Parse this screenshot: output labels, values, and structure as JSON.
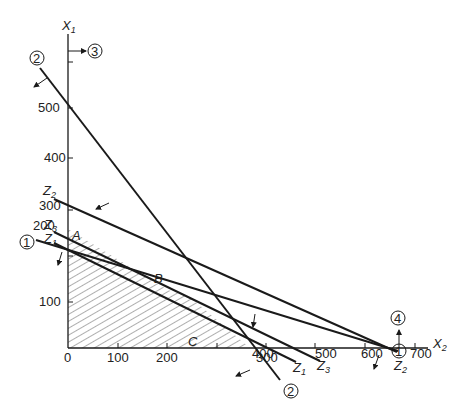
{
  "figure": {
    "axes": {
      "x_label": "X",
      "x_label_sub": "2",
      "y_label": "X",
      "y_label_sub": "1",
      "x_ticks": [
        "0",
        "100",
        "200",
        "300",
        "400",
        "500",
        "600",
        "700"
      ],
      "y_ticks": [
        "100",
        "200",
        "300",
        "400",
        "500"
      ]
    },
    "points": {
      "A": "A",
      "B": "B",
      "C": "C"
    },
    "constraints": {
      "c1": "1",
      "c2": "2",
      "c3": "3",
      "c4": "4"
    },
    "objective_lines": {
      "z1": {
        "base": "Z",
        "sub": "1"
      },
      "z2": {
        "base": "Z",
        "sub": "2"
      },
      "z3": {
        "base": "Z",
        "sub": "3"
      }
    },
    "colors": {
      "line": "#1a1a1a",
      "hatch": "#333333",
      "background": "#ffffff"
    }
  }
}
